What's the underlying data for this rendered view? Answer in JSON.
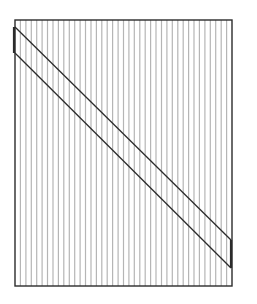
{
  "diagram": {
    "title": "",
    "hatch": {
      "orientation": "vertical",
      "count": 39,
      "color": "#b5b5b5"
    },
    "frame": {
      "color": "#2b2b2b"
    },
    "band": {
      "color": "#2b2b2b",
      "direction": "top-left to bottom-right"
    }
  }
}
